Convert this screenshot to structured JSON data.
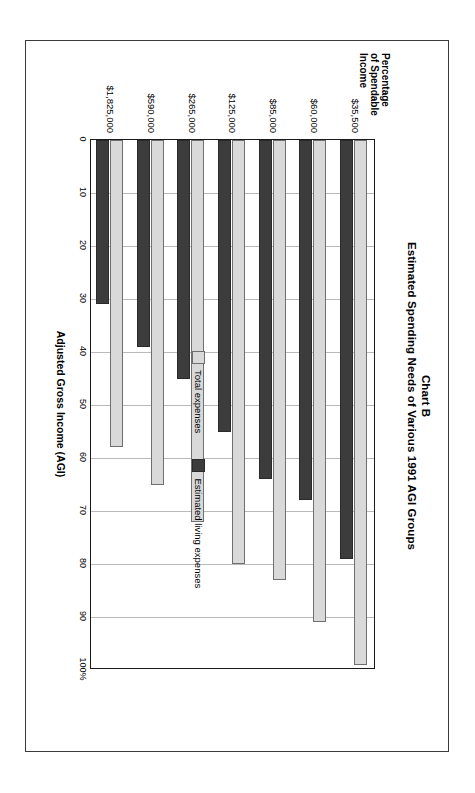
{
  "chart_data": {
    "type": "bar",
    "orientation": "horizontal",
    "title": "Chart B",
    "subtitle": "Estimated Spending Needs of Various 1991 AGI Groups",
    "xlabel": "Adjusted Gross Income (AGI)",
    "ylabel": "Percentage of Spendable Income",
    "ylabel_lines": [
      "Percentage",
      "of Spendable",
      "Income"
    ],
    "categories": [
      "$35,500",
      "$60,000",
      "$85,000",
      "$125,000",
      "$265,000",
      "$590,000",
      "$1,825,000"
    ],
    "ticks": [
      "0",
      "10",
      "20",
      "30",
      "40",
      "50",
      "60",
      "70",
      "80",
      "90",
      "100%"
    ],
    "tick_values": [
      0,
      10,
      20,
      30,
      40,
      50,
      60,
      70,
      80,
      90,
      100
    ],
    "ylim": [
      0,
      100
    ],
    "grid": true,
    "legend_position": "inside-right",
    "series": [
      {
        "name": "Total expenses",
        "color": "#d9d9d9",
        "values": [
          99,
          91,
          83,
          80,
          72,
          65,
          58
        ]
      },
      {
        "name": "Estimated living expenses",
        "color": "#3c3c3c",
        "values": [
          79,
          68,
          64,
          55,
          45,
          39,
          31
        ]
      }
    ]
  }
}
